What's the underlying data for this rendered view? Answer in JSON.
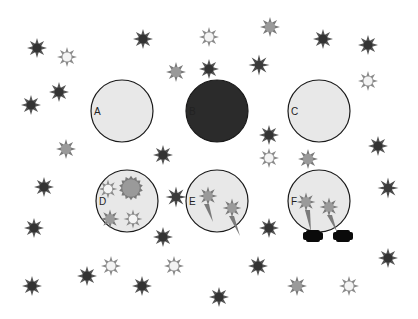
{
  "colors": {
    "background": "#ffffff",
    "circle_fill_light": "#e8e8e8",
    "circle_fill_dark": "#2b2b2b",
    "circle_stroke": "#1a1a1a",
    "star_dark_core": "#333333",
    "star_dark_spikes": "#555555",
    "star_gray_core": "#9a9a9a",
    "star_gray_spikes": "#7a7a7a",
    "star_white_core": "#f4f4f4",
    "star_white_spikes": "#8a8a8a",
    "blob": "#0a0a0a"
  },
  "panels": [
    {
      "label": "A",
      "cx": 122,
      "cy": 111,
      "r": 31,
      "fill": "light"
    },
    {
      "label": "B",
      "cx": 217,
      "cy": 111,
      "r": 31,
      "fill": "dark"
    },
    {
      "label": "C",
      "cx": 319,
      "cy": 111,
      "r": 31,
      "fill": "light"
    },
    {
      "label": "D",
      "cx": 127,
      "cy": 201,
      "r": 31,
      "fill": "light"
    },
    {
      "label": "E",
      "cx": 217,
      "cy": 201,
      "r": 31,
      "fill": "light"
    },
    {
      "label": "F",
      "cx": 319,
      "cy": 201,
      "r": 31,
      "fill": "light"
    }
  ],
  "inner_cells": {
    "D": [
      {
        "x": 108,
        "y": 189,
        "type": "white",
        "r": 7
      },
      {
        "x": 131,
        "y": 188,
        "type": "gray_round",
        "r": 9
      },
      {
        "x": 110,
        "y": 219,
        "type": "gray",
        "r": 7
      },
      {
        "x": 133,
        "y": 219,
        "type": "white",
        "r": 7
      }
    ],
    "E": [
      {
        "x": 208,
        "y": 196,
        "type": "gray",
        "r": 7,
        "tail": [
          [
            206,
            204
          ],
          [
            213,
            222
          ]
        ]
      },
      {
        "x": 232,
        "y": 208,
        "type": "gray",
        "r": 7,
        "tail": [
          [
            231,
            216
          ],
          [
            240,
            236
          ]
        ]
      }
    ],
    "F": [
      {
        "x": 306,
        "y": 202,
        "type": "gray",
        "r": 7,
        "tail": [
          [
            307,
            210
          ],
          [
            311,
            232
          ]
        ]
      },
      {
        "x": 329,
        "y": 207,
        "type": "gray",
        "r": 7,
        "tail": [
          [
            329,
            215
          ],
          [
            337,
            232
          ]
        ]
      }
    ]
  },
  "blobs": [
    {
      "x": 313,
      "y": 236,
      "w": 20,
      "h": 12
    },
    {
      "x": 343,
      "y": 236,
      "w": 20,
      "h": 12
    }
  ],
  "stars": [
    {
      "x": 37,
      "y": 48,
      "type": "dark"
    },
    {
      "x": 67,
      "y": 57,
      "type": "white"
    },
    {
      "x": 143,
      "y": 39,
      "type": "dark"
    },
    {
      "x": 209,
      "y": 37,
      "type": "white"
    },
    {
      "x": 176,
      "y": 72,
      "type": "gray"
    },
    {
      "x": 209,
      "y": 69,
      "type": "dark"
    },
    {
      "x": 270,
      "y": 27,
      "type": "gray"
    },
    {
      "x": 259,
      "y": 65,
      "type": "dark2"
    },
    {
      "x": 323,
      "y": 39,
      "type": "dark"
    },
    {
      "x": 368,
      "y": 45,
      "type": "dark"
    },
    {
      "x": 368,
      "y": 81,
      "type": "white"
    },
    {
      "x": 59,
      "y": 92,
      "type": "dark"
    },
    {
      "x": 31,
      "y": 105,
      "type": "dark"
    },
    {
      "x": 66,
      "y": 149,
      "type": "gray"
    },
    {
      "x": 163,
      "y": 155,
      "type": "dark"
    },
    {
      "x": 269,
      "y": 135,
      "type": "dark"
    },
    {
      "x": 269,
      "y": 158,
      "type": "white"
    },
    {
      "x": 308,
      "y": 159,
      "type": "gray"
    },
    {
      "x": 378,
      "y": 146,
      "type": "dark"
    },
    {
      "x": 44,
      "y": 187,
      "type": "dark"
    },
    {
      "x": 176,
      "y": 197,
      "type": "dark2"
    },
    {
      "x": 388,
      "y": 188,
      "type": "dark2"
    },
    {
      "x": 34,
      "y": 228,
      "type": "dark"
    },
    {
      "x": 163,
      "y": 237,
      "type": "dark"
    },
    {
      "x": 269,
      "y": 228,
      "type": "dark"
    },
    {
      "x": 388,
      "y": 258,
      "type": "dark"
    },
    {
      "x": 111,
      "y": 266,
      "type": "white"
    },
    {
      "x": 174,
      "y": 266,
      "type": "white"
    },
    {
      "x": 87,
      "y": 276,
      "type": "dark"
    },
    {
      "x": 142,
      "y": 286,
      "type": "dark"
    },
    {
      "x": 32,
      "y": 286,
      "type": "dark"
    },
    {
      "x": 258,
      "y": 266,
      "type": "dark"
    },
    {
      "x": 297,
      "y": 286,
      "type": "gray"
    },
    {
      "x": 349,
      "y": 286,
      "type": "white"
    },
    {
      "x": 219,
      "y": 297,
      "type": "dark"
    }
  ]
}
